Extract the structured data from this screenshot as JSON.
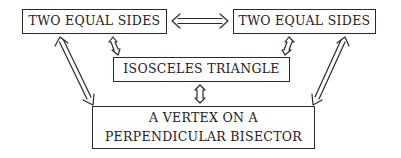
{
  "diagram": {
    "nodes": {
      "top_left": {
        "label": "TWO EQUAL SIDES"
      },
      "top_right": {
        "label": "TWO EQUAL SIDES"
      },
      "middle": {
        "label": "ISOSCELES TRIANGLE"
      },
      "bottom": {
        "line1": "A VERTEX ON A",
        "line2": "PERPENDICULAR BISECTOR"
      }
    },
    "edges": [
      {
        "from": "top_left",
        "to": "top_right",
        "type": "double-line bidirectional"
      },
      {
        "from": "top_left",
        "to": "middle",
        "type": "small bidirectional"
      },
      {
        "from": "top_right",
        "to": "middle",
        "type": "small bidirectional"
      },
      {
        "from": "middle",
        "to": "bottom",
        "type": "small bidirectional"
      },
      {
        "from": "top_left",
        "to": "bottom",
        "type": "double-line bidirectional"
      },
      {
        "from": "top_right",
        "to": "bottom",
        "type": "double-line bidirectional"
      }
    ],
    "colors": {
      "ink": "#2a2a2a",
      "background": "#ffffff"
    }
  }
}
